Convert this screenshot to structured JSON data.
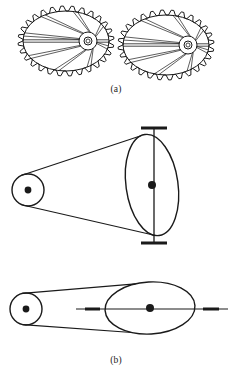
{
  "figure": {
    "kind": "mechanical-engineering-line-drawing",
    "background_color": "#ffffff",
    "line_color": "#1a1a1a",
    "panels": [
      {
        "id": "a",
        "caption": "(a)",
        "subject": "pair-of-meshing-elliptical-spur-gears",
        "elements": [
          {
            "name": "left-elliptical-gear",
            "shape": "ellipse",
            "center_x": 66,
            "center_y": 41,
            "radius_x": 43,
            "radius_y": 30,
            "tooth_count": 28,
            "tooth_height": 5,
            "hub": {
              "center_x": 88,
              "center_y": 41,
              "outer_radius": 9,
              "inner_radius": 4,
              "bore_radius": 2
            },
            "spoke_count": 8,
            "has_horizontal_chord": true
          },
          {
            "name": "right-elliptical-gear",
            "shape": "ellipse",
            "center_x": 166,
            "center_y": 45,
            "radius_x": 43,
            "radius_y": 30,
            "tooth_count": 28,
            "tooth_height": 5,
            "hub": {
              "center_x": 188,
              "center_y": 45,
              "outer_radius": 9,
              "inner_radius": 4,
              "bore_radius": 2
            },
            "spoke_count": 8,
            "has_horizontal_chord": true
          },
          {
            "name": "gear-mesh-point",
            "x": 115,
            "y": 43
          }
        ]
      },
      {
        "id": "b",
        "caption": "(b)",
        "subject": "belt-drive-two-views-vertical-and-horizontal-shaft",
        "views": [
          {
            "name": "belt-drive-vertical-shaft-view",
            "small_pulley": {
              "center_x": 28,
              "center_y": 190,
              "radius": 16,
              "hub_dot_radius": 3.4
            },
            "large_pulley": {
              "center_x": 152,
              "center_y": 185,
              "radius_x": 26,
              "radius_y": 51,
              "rotation_deg": -8,
              "hub_dot_radius": 4
            },
            "shaft": {
              "orientation": "vertical",
              "x": 154,
              "top_y": 128,
              "bottom_y": 243,
              "cap_half_width": 13,
              "cap_thickness": 3
            },
            "belt": {
              "upper_tangent": true,
              "lower_tangent": true
            }
          },
          {
            "name": "belt-drive-horizontal-shaft-view",
            "small_pulley": {
              "center_x": 26,
              "center_y": 309,
              "radius": 16,
              "hub_dot_radius": 3.4
            },
            "large_pulley": {
              "center_x": 150,
              "center_y": 308,
              "radius_x": 45,
              "radius_y": 26,
              "rotation_deg": -3,
              "hub_dot_radius": 4
            },
            "shaft": {
              "orientation": "horizontal",
              "y": 309,
              "left_x": 76,
              "right_x": 228,
              "bearing_marks": [
                {
                  "x1": 85,
                  "x2": 100,
                  "thickness": 3
                },
                {
                  "x1": 203,
                  "x2": 219,
                  "thickness": 3
                }
              ]
            },
            "belt": {
              "upper_tangent": true,
              "lower_tangent": true
            }
          }
        ]
      }
    ]
  },
  "captions": {
    "a": "(a)",
    "b": "(b)"
  }
}
